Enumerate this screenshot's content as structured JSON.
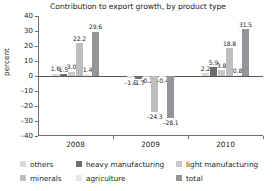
{
  "chart_data": {
    "type": "bar",
    "title": "Contribution to export growth, by product type",
    "xlabel": "",
    "ylabel": "percent",
    "categories": [
      "2008",
      "2009",
      "2010"
    ],
    "ylim": [
      -40,
      40
    ],
    "yticks": [
      40,
      30,
      20,
      10,
      0,
      -10,
      -20,
      -30,
      -40
    ],
    "grid": false,
    "legend_position": "bottom",
    "series": [
      {
        "name": "others",
        "color": "#d9dadb",
        "values": [
          1.6,
          -1.5,
          2.2
        ]
      },
      {
        "name": "heavy manufacturing",
        "color": "#6d6e71",
        "values": [
          1.5,
          -1.7,
          5.9
        ]
      },
      {
        "name": "light manufacturing",
        "color": "#c7c8ca",
        "values": [
          3.0,
          -0.2,
          3.8
        ]
      },
      {
        "name": "minerals",
        "color": "#bcbec0",
        "values": [
          22.2,
          -24.3,
          18.8
        ]
      },
      {
        "name": "agriculture",
        "color": "#e6e7e8",
        "values": [
          1.4,
          -0.4,
          0.8
        ]
      },
      {
        "name": "total",
        "color": "#939598",
        "values": [
          29.6,
          -28.1,
          31.5
        ]
      }
    ],
    "value_labels": {
      "2008": [
        "1.6",
        "1.5",
        "3.0",
        "22.2",
        "1.4",
        "29.6"
      ],
      "2009": [
        "-1.5",
        "-1.7",
        "-0.2",
        "-24.3",
        "-0.4",
        "-28.1"
      ],
      "2010": [
        "2.2",
        "5.9",
        "3.8",
        "18.8",
        "0.8",
        "31.5"
      ]
    }
  },
  "legend": {
    "rows": [
      [
        {
          "label": "others",
          "color": "#d9dadb",
          "x": 0
        },
        {
          "label": "heavy manufacturing",
          "color": "#6d6e71",
          "x": 56
        },
        {
          "label": "light manufacturing",
          "color": "#c7c8ca",
          "x": 156
        }
      ],
      [
        {
          "label": "minerals",
          "color": "#bcbec0",
          "x": 0
        },
        {
          "label": "agriculture",
          "color": "#e6e7e8",
          "x": 56
        },
        {
          "label": "total",
          "color": "#939598",
          "x": 156
        }
      ]
    ]
  }
}
